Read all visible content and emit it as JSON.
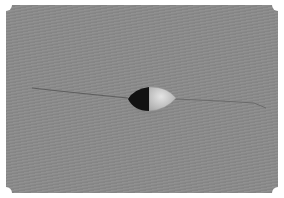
{
  "image": {
    "description": "Grayscale micrograph of a small ovoid particle on a thin fiber",
    "colors": {
      "background": "#8a8a8a",
      "frame": "#ffffff",
      "particle_dark": "#111111",
      "particle_light": "#d2d2d2",
      "fiber": "#5e5e5e"
    }
  }
}
